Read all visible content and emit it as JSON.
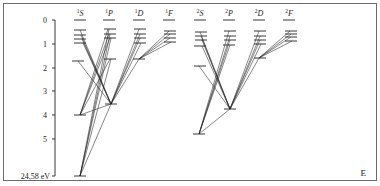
{
  "diagram": {
    "type": "grotrian-energy-level-diagram",
    "axis": {
      "ticks": [
        {
          "label": "0",
          "y": 20
        },
        {
          "label": "1",
          "y": 44
        },
        {
          "label": "2",
          "y": 68
        },
        {
          "label": "3",
          "y": 91
        },
        {
          "label": "4",
          "y": 115
        },
        {
          "label": "5",
          "y": 139
        },
        {
          "label": "24,58 eV",
          "y": 176
        }
      ],
      "corner_label": "E"
    },
    "columns": [
      {
        "mult": "1",
        "term": "S",
        "x": 80
      },
      {
        "mult": "1",
        "term": "P",
        "x": 109
      },
      {
        "mult": "1",
        "term": "D",
        "x": 139
      },
      {
        "mult": "1",
        "term": "F",
        "x": 169
      },
      {
        "mult": "2",
        "term": "S",
        "x": 200
      },
      {
        "mult": "2",
        "term": "P",
        "x": 229
      },
      {
        "mult": "2",
        "term": "D",
        "x": 259
      },
      {
        "mult": "2",
        "term": "F",
        "x": 289
      }
    ],
    "colors": {
      "line": "#222222",
      "frame": "#6b6b6b"
    }
  }
}
